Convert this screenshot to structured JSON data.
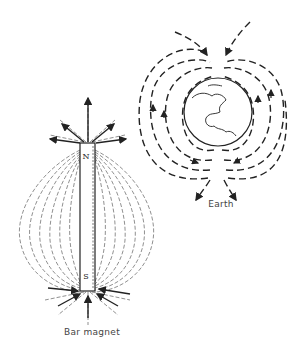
{
  "figure": {
    "earth": {
      "label": "Earth",
      "center": [
        218,
        112
      ],
      "radius": 35
    },
    "bar_magnet": {
      "label": "Bar magnet",
      "north_label": "N",
      "south_label": "S"
    }
  },
  "colors": {
    "ink": "#222222",
    "background": "#ffffff"
  }
}
